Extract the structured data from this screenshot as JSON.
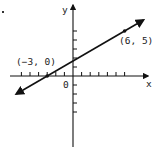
{
  "chart_data": {
    "type": "line",
    "title": "",
    "xlabel": "x",
    "ylabel": "y",
    "origin_label": "0",
    "grid": false,
    "xlim": [
      -7,
      9
    ],
    "ylim": [
      -8,
      8
    ],
    "x_ticks": [
      -6,
      -5,
      -4,
      -3,
      -2,
      -1,
      1,
      2,
      3,
      4,
      5,
      6
    ],
    "y_ticks": [
      -4,
      -3,
      -2,
      -1,
      1,
      2,
      3,
      4,
      5
    ],
    "series": [
      {
        "name": "line through (-3, 0) and (6, 5)",
        "x": [
          -3,
          6
        ],
        "y": [
          0,
          5
        ],
        "slope": 0.5556,
        "y_intercept": 1.6667,
        "arrows_both_ends": true
      }
    ],
    "points": [
      {
        "x": -3,
        "y": 0,
        "label": "(-3, 0)"
      },
      {
        "x": 6,
        "y": 5,
        "label": "(6, 5)"
      }
    ]
  },
  "labels": {
    "x_axis": "x",
    "y_axis": "y",
    "origin": "0",
    "point_a": "(−3, 0)",
    "point_b": "(6, 5)"
  },
  "colors": {
    "ink": "#111111",
    "background": "#ffffff"
  }
}
